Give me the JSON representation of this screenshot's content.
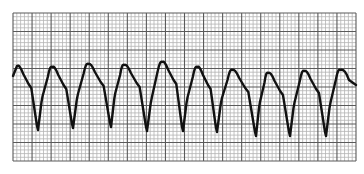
{
  "chart_data": {
    "type": "line",
    "title": "",
    "xlabel": "",
    "ylabel": "",
    "grid": {
      "on": true,
      "major_spacing_px": 19,
      "minor_per_major": 5,
      "minor_color": "#b4b4b4",
      "major_color": "#5a5a5a",
      "x_range_px": [
        13,
        356
      ],
      "y_range_px": [
        13,
        161
      ]
    },
    "trace_color": "#111111",
    "beat_count": 10,
    "peaks": [
      {
        "x": 17,
        "y": 66
      },
      {
        "x": 52,
        "y": 67
      },
      {
        "x": 88,
        "y": 64
      },
      {
        "x": 124,
        "y": 65
      },
      {
        "x": 162,
        "y": 62
      },
      {
        "x": 197,
        "y": 67
      },
      {
        "x": 232,
        "y": 70
      },
      {
        "x": 268,
        "y": 73
      },
      {
        "x": 304,
        "y": 71
      },
      {
        "x": 340,
        "y": 70
      }
    ],
    "troughs": [
      {
        "x": 38,
        "y": 130
      },
      {
        "x": 73,
        "y": 128
      },
      {
        "x": 111,
        "y": 127
      },
      {
        "x": 147,
        "y": 131
      },
      {
        "x": 183,
        "y": 131
      },
      {
        "x": 217,
        "y": 132
      },
      {
        "x": 256,
        "y": 136
      },
      {
        "x": 290,
        "y": 136
      },
      {
        "x": 326,
        "y": 136
      }
    ],
    "end_point": {
      "x": 356,
      "y": 85
    }
  }
}
